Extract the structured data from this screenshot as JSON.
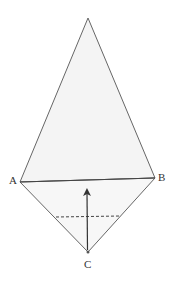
{
  "diagram": {
    "points": {
      "A": "A",
      "B": "B",
      "C": "C"
    },
    "colors": {
      "stroke": "#555555",
      "fill": "#f4f4f4",
      "text": "#333333"
    }
  }
}
